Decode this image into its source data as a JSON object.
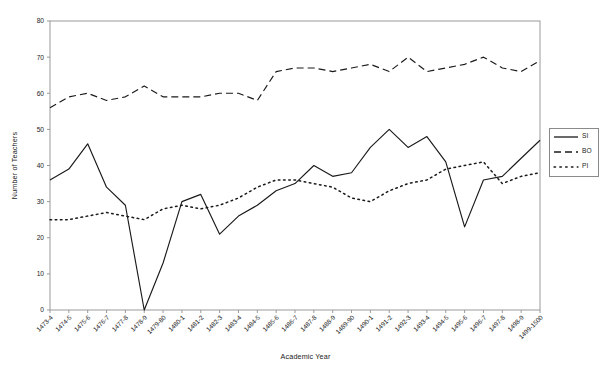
{
  "chart_data": {
    "type": "line",
    "title": "",
    "xlabel": "Academic Year",
    "ylabel": "Number of Teachers",
    "ylim": [
      0,
      80
    ],
    "ytick_step": 10,
    "yticks": [
      0,
      10,
      20,
      30,
      40,
      50,
      60,
      70,
      80
    ],
    "grid": false,
    "legend_position": "right-outside",
    "categories": [
      "1473-4",
      "1474-5",
      "1475-6",
      "1476-7",
      "1477-8",
      "1478-9",
      "1479-80",
      "1480-1",
      "1481-2",
      "1482-3",
      "1483-4",
      "1484-5",
      "1485-6",
      "1486-7",
      "1487-8",
      "1488-9",
      "1489-90",
      "1490-1",
      "1491-2",
      "1492-3",
      "1493-4",
      "1494-5",
      "1495-6",
      "1496-7",
      "1497-8",
      "1498-9",
      "1499-1500"
    ],
    "series": [
      {
        "name": "SI",
        "style": "solid",
        "color": "#1a1a1a",
        "values": [
          36,
          39,
          46,
          34,
          29,
          0,
          13,
          30,
          32,
          21,
          26,
          29,
          33,
          35,
          40,
          37,
          38,
          45,
          50,
          45,
          48,
          41,
          23,
          36,
          37,
          42,
          47
        ]
      },
      {
        "name": "BO",
        "style": "dashed",
        "color": "#1a1a1a",
        "values": [
          56,
          59,
          60,
          58,
          59,
          62,
          59,
          59,
          59,
          60,
          60,
          58,
          66,
          67,
          67,
          66,
          67,
          68,
          66,
          70,
          66,
          67,
          68,
          70,
          67,
          66,
          69
        ]
      },
      {
        "name": "PI",
        "style": "dotted",
        "color": "#1a1a1a",
        "values": [
          25,
          25,
          26,
          27,
          26,
          25,
          28,
          29,
          28,
          29,
          31,
          34,
          36,
          36,
          35,
          34,
          31,
          30,
          33,
          35,
          36,
          39,
          40,
          41,
          35,
          37,
          38
        ]
      }
    ]
  },
  "legend": {
    "items": [
      {
        "label": "SI"
      },
      {
        "label": "BO"
      },
      {
        "label": "PI"
      }
    ]
  },
  "axes": {
    "x_title": "Academic Year",
    "y_title": "Number of Teachers"
  }
}
